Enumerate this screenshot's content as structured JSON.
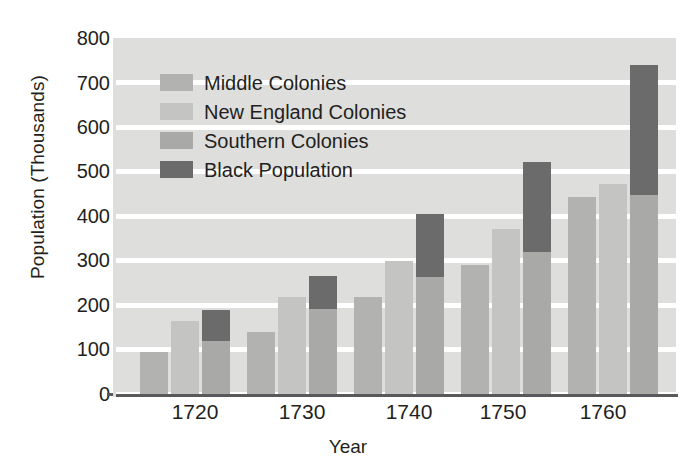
{
  "chart_data": {
    "type": "bar",
    "title": "",
    "subtitle": "",
    "xlabel": "Year",
    "ylabel": "Population (Thousands)",
    "categories": [
      "1720",
      "1730",
      "1740",
      "1750",
      "1760"
    ],
    "ylim": [
      0,
      800
    ],
    "yticks": [
      0,
      100,
      200,
      300,
      400,
      500,
      600,
      700,
      800
    ],
    "grid": "horizontal-white-lines",
    "legend_position": "inside-upper-left",
    "stacked_note": "Southern Colonies bar is stacked with Black Population on top",
    "series": [
      {
        "name": "Middle Colonies",
        "color": "#b2b2b0",
        "values": [
          95,
          140,
          218,
          290,
          442
        ]
      },
      {
        "name": "New England Colonies",
        "color": "#c4c4c2",
        "values": [
          165,
          217,
          300,
          370,
          472
        ]
      },
      {
        "name": "Southern Colonies",
        "color": "#a9a9a7",
        "values": [
          120,
          190,
          262,
          318,
          447
        ]
      },
      {
        "name": "Black Population",
        "color": "#6b6b6b",
        "values": [
          68,
          75,
          143,
          204,
          293
        ]
      }
    ],
    "southern_plus_black_totals": [
      188,
      265,
      405,
      522,
      740
    ]
  },
  "legend": {
    "items": [
      {
        "label": "Middle Colonies",
        "swatch": "#b2b2b0"
      },
      {
        "label": "New England Colonies",
        "swatch": "#c4c4c2"
      },
      {
        "label": "Southern Colonies",
        "swatch": "#a9a9a7"
      },
      {
        "label": "Black Population",
        "swatch": "#6b6b6b"
      }
    ]
  },
  "axes": {
    "y_labels": [
      "800",
      "700",
      "600",
      "500",
      "400",
      "300",
      "200",
      "100",
      "0"
    ],
    "x_labels": [
      "1720",
      "1730",
      "1740",
      "1750",
      "1760"
    ],
    "y_title": "Population (Thousands)",
    "x_title": "Year"
  },
  "colors": {
    "plot_background": "#dededc",
    "gridline": "#ffffff",
    "axis": "#58595b",
    "text": "#231f20"
  }
}
